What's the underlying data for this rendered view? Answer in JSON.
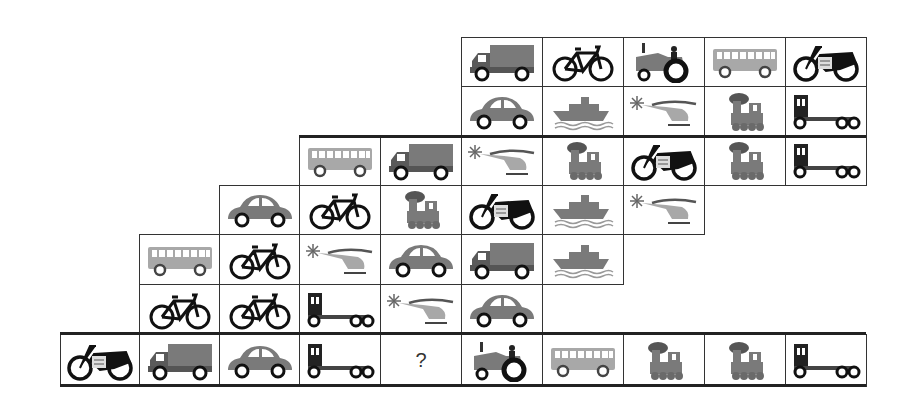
{
  "puzzle": {
    "description": "Vehicle pattern grid puzzle",
    "question_mark": "?",
    "colors": {
      "grid_line": "#333333",
      "vehicle_gray": "#7a7a7a",
      "vehicle_light_gray": "#a8a8a8",
      "vehicle_dark": "#1a1a1a"
    },
    "rows": [
      {
        "row": 0,
        "start_col": 5,
        "cells": [
          "truck",
          "bicycle",
          "tractor",
          "bus",
          "motorcycle"
        ]
      },
      {
        "row": 1,
        "start_col": 5,
        "cells": [
          "car",
          "ship",
          "helicopter",
          "train",
          "tow-truck"
        ]
      },
      {
        "row": 2,
        "start_col": 3,
        "cells": [
          "bus",
          "truck",
          "helicopter",
          "train",
          "motorcycle",
          "train",
          "tow-truck"
        ]
      },
      {
        "row": 3,
        "start_col": 2,
        "cells": [
          "car",
          "bicycle",
          "train",
          "motorcycle",
          "ship",
          "helicopter"
        ]
      },
      {
        "row": 4,
        "start_col": 1,
        "cells": [
          "bus",
          "bicycle",
          "helicopter",
          "car",
          "truck",
          "ship"
        ]
      },
      {
        "row": 5,
        "start_col": 1,
        "cells": [
          "bicycle",
          "bicycle",
          "tow-truck",
          "helicopter",
          "car"
        ]
      },
      {
        "row": 6,
        "start_col": 0,
        "cells": [
          "motorcycle",
          "truck",
          "car",
          "tow-truck",
          "?",
          "tractor",
          "bus",
          "train",
          "train",
          "tow-truck"
        ]
      }
    ]
  }
}
